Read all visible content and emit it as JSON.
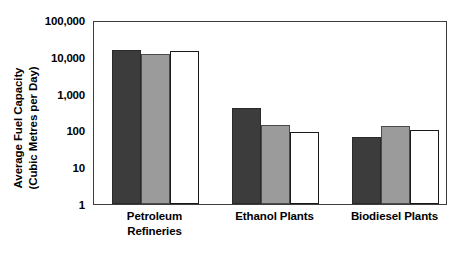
{
  "chart_data": {
    "type": "bar",
    "title": "",
    "xlabel": "",
    "ylabel": "Average Fuel Capacity (Cubic Metres per Day)",
    "ylabel_line1": "Average Fuel Capacity",
    "ylabel_line2": "(Cubic Metres per Day)",
    "yscale": "log",
    "ylim": [
      1,
      100000
    ],
    "grid": false,
    "legend": "none",
    "ytick_labels": [
      "100,000",
      "10,000",
      "1,000",
      "100",
      "10",
      "1"
    ],
    "ytick_values": [
      100000,
      10000,
      1000,
      100,
      10,
      1
    ],
    "categories": [
      "Petroleum Refineries",
      "Ethanol Plants",
      "Biodiesel Plants"
    ],
    "category_lines": [
      [
        "Petroleum",
        "Refineries"
      ],
      [
        "Ethanol Plants"
      ],
      [
        "Biodiesel Plants"
      ]
    ],
    "series": [
      {
        "name": "series-1",
        "color": "#3c3c3c",
        "values": [
          15000,
          400,
          65
        ]
      },
      {
        "name": "series-2",
        "color": "#9b9b9b",
        "values": [
          12000,
          140,
          135
        ]
      },
      {
        "name": "series-3",
        "color": "#ffffff",
        "values": [
          14000,
          90,
          105
        ]
      }
    ]
  },
  "colors": {
    "series_dark": "#3c3c3c",
    "series_gray": "#9b9b9b",
    "series_white": "#ffffff",
    "axis": "#3d3d3d",
    "text": "#000000",
    "background": "#ffffff"
  }
}
